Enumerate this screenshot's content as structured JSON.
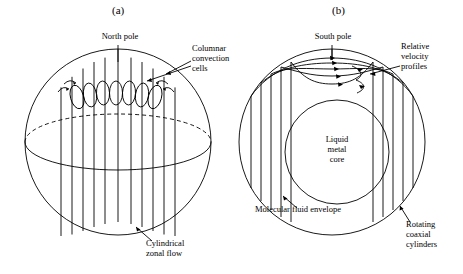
{
  "figure": {
    "panels": [
      {
        "id": "a",
        "label": "(a)",
        "annotations": [
          {
            "name": "north-pole",
            "text": "North pole"
          },
          {
            "name": "columnar-convection-cells",
            "text": "Columnar\nconvection\ncells"
          },
          {
            "name": "cylindrical-zonal-flow",
            "text": "Cylindrical\nzonal flow"
          }
        ]
      },
      {
        "id": "b",
        "label": "(b)",
        "annotations": [
          {
            "name": "south-pole",
            "text": "South pole"
          },
          {
            "name": "relative-velocity-profiles",
            "text": "Relative\nvelocity\nprofiles"
          },
          {
            "name": "liquid-metal-core",
            "text": "Liquid\nmetal\ncore"
          },
          {
            "name": "molecular-fluid-envelope",
            "text": "Molecular fluid envelope"
          },
          {
            "name": "rotating-coaxial-cylinders",
            "text": "Rotating\ncoaxial\ncylinders"
          }
        ]
      }
    ],
    "colors": {
      "stroke": "#000000",
      "background": "#ffffff"
    }
  }
}
